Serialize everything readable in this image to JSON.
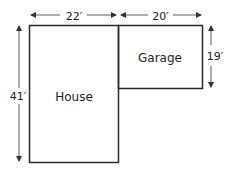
{
  "diagram": {
    "rooms": [
      {
        "name": "House"
      },
      {
        "name": "Garage"
      }
    ],
    "dimensions": {
      "house_width": "22′",
      "garage_width": "20′",
      "garage_depth": "19′",
      "house_depth": "41′"
    },
    "colors": {
      "line": "#2a2a2a",
      "text": "#222222",
      "background": "#ffffff"
    }
  }
}
